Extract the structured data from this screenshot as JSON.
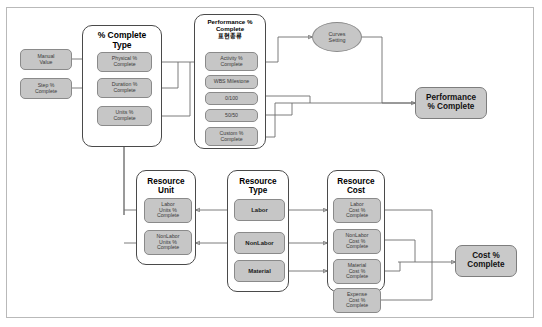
{
  "diagram": {
    "title_present": false,
    "colors": {
      "node_fill": "#c6c6c6",
      "node_border": "#8a8a8a",
      "group_border": "#4a4a4a",
      "frame_border": "#b9b9b9",
      "wire": "#6e6e6e",
      "background": "#ffffff"
    }
  },
  "inputs": {
    "manual_value": "Manual\nValue",
    "manual_value_line1": "Manual",
    "manual_value_line2": "Value",
    "step_pct_line1": "Step %",
    "step_pct_line2": "Complete"
  },
  "groups": {
    "complete_type": {
      "title_line1": "% Complete",
      "title_line2": "Type",
      "items": [
        {
          "line1": "Physical %",
          "line2": "Complete"
        },
        {
          "line1": "Duration %",
          "line2": "Complete"
        },
        {
          "line1": "Units %",
          "line2": "Complete"
        }
      ]
    },
    "performance_complete": {
      "title_line1": "Performance %",
      "title_line2": "Complete",
      "title_line3": "표현종류",
      "items": [
        {
          "line1": "Activity %",
          "line2": "Complete"
        },
        {
          "line1": "WBS Milestone",
          "line2": ""
        },
        {
          "line1": "0/100",
          "line2": ""
        },
        {
          "line1": "50/50",
          "line2": ""
        },
        {
          "line1": "Custom %",
          "line2": "Complete"
        }
      ]
    },
    "resource_unit": {
      "title_line1": "Resource",
      "title_line2": "Unit",
      "items": [
        {
          "line1": "Labor",
          "line2": "Units %",
          "line3": "Complete"
        },
        {
          "line1": "NonLabor",
          "line2": "Units %",
          "line3": "Complete"
        }
      ]
    },
    "resource_type": {
      "title_line1": "Resource",
      "title_line2": "Type",
      "items": [
        {
          "label": "Labor"
        },
        {
          "label": "NonLabor"
        },
        {
          "label": "Material"
        }
      ]
    },
    "resource_cost": {
      "title_line1": "Resource",
      "title_line2": "Cost",
      "items": [
        {
          "line1": "Labor",
          "line2": "Cost %",
          "line3": "Complete"
        },
        {
          "line1": "NonLabor",
          "line2": "Cost %",
          "line3": "Complete"
        },
        {
          "line1": "Material",
          "line2": "Cost %",
          "line3": "Complete"
        }
      ]
    }
  },
  "standalone": {
    "curves_setting_line1": "Curves",
    "curves_setting_line2": "Setting",
    "expense_cost_line1": "Expense",
    "expense_cost_line2": "Cost %",
    "expense_cost_line3": "Complete"
  },
  "outputs": {
    "performance_pct_line1": "Performance",
    "performance_pct_line2": "% Complete",
    "cost_pct_line1": "Cost %",
    "cost_pct_line2": "Complete"
  }
}
